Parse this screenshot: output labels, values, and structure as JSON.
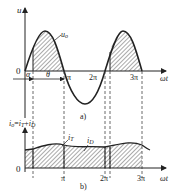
{
  "figure": {
    "panel_a": {
      "caption": "a)",
      "y_axis_label": "u",
      "curve_label": "u_o",
      "curve_label_main": "u",
      "curve_label_sub": "o",
      "origin_label": "0",
      "x_axis_label": "ωt",
      "angle_labels": {
        "alpha": "α",
        "theta": "θ"
      },
      "x_ticks": [
        "π",
        "2π",
        "3π"
      ]
    },
    "panel_b": {
      "caption": "b)",
      "y_axis_label": "i_o = i_T + i_D",
      "y_axis_label_parts": {
        "i0": "i",
        "s0": "o",
        "eq": "=",
        "iT": "i",
        "sT": "T",
        "plus": "+",
        "iD": "i",
        "sD": "D"
      },
      "origin_label": "0",
      "x_axis_label": "ωt",
      "curve_labels": {
        "iT_main": "i",
        "iT_sub": "T",
        "iD_main": "i",
        "iD_sub": "D"
      },
      "x_ticks": [
        "π",
        "2π",
        "3π"
      ]
    },
    "colors": {
      "line": "#222222",
      "hatch": "#555555",
      "background": "#ffffff"
    }
  }
}
